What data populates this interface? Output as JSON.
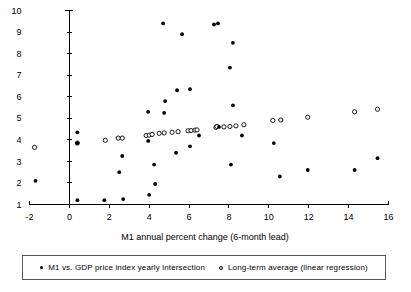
{
  "chart_data": {
    "type": "scatter",
    "title": "",
    "xlabel": "M1 annual percent change (6-month lead)",
    "ylabel": "",
    "xlim": [
      -2,
      16
    ],
    "ylim": [
      1,
      10
    ],
    "grid": false,
    "legend_position": "bottom",
    "xticks": [
      "-2",
      "0",
      "2",
      "4",
      "6",
      "8",
      "10",
      "12",
      "14",
      "16"
    ],
    "xtick_values": [
      -2,
      0,
      2,
      4,
      6,
      8,
      10,
      12,
      14,
      16
    ],
    "yticks": [
      "1",
      "2",
      "3",
      "4",
      "5",
      "6",
      "7",
      "8",
      "9",
      "10"
    ],
    "ytick_values": [
      1,
      2,
      3,
      4,
      5,
      6,
      7,
      8,
      9,
      10
    ],
    "series": [
      {
        "name": "M1 vs. GDP price index yearly intersection",
        "marker": "filled-circle",
        "color": "#000000",
        "points": [
          [
            -1.7,
            2.1
          ],
          [
            0.4,
            4.35
          ],
          [
            0.4,
            3.85
          ],
          [
            0.4,
            1.2
          ],
          [
            1.75,
            1.2
          ],
          [
            2.5,
            2.5
          ],
          [
            2.65,
            3.25
          ],
          [
            2.7,
            1.25
          ],
          [
            3.95,
            5.3
          ],
          [
            3.95,
            3.95
          ],
          [
            4.0,
            1.45
          ],
          [
            4.25,
            2.85
          ],
          [
            4.3,
            1.95
          ],
          [
            4.7,
            9.4
          ],
          [
            4.75,
            5.25
          ],
          [
            4.8,
            5.8
          ],
          [
            5.35,
            3.4
          ],
          [
            5.4,
            6.3
          ],
          [
            5.65,
            8.9
          ],
          [
            6.05,
            6.35
          ],
          [
            6.05,
            3.7
          ],
          [
            6.5,
            4.2
          ],
          [
            7.25,
            9.35
          ],
          [
            7.45,
            9.4
          ],
          [
            7.5,
            4.6
          ],
          [
            8.05,
            7.35
          ],
          [
            8.1,
            2.85
          ],
          [
            8.2,
            8.5
          ],
          [
            8.2,
            5.6
          ],
          [
            8.65,
            4.2
          ],
          [
            10.25,
            3.85
          ],
          [
            10.55,
            2.3
          ],
          [
            11.95,
            2.6
          ],
          [
            14.3,
            2.6
          ],
          [
            15.45,
            3.15
          ]
        ]
      },
      {
        "name": "Long-term average (linear regression)",
        "marker": "open-circle",
        "color": "#000000",
        "points": [
          [
            -1.75,
            3.65
          ],
          [
            0.4,
            3.85
          ],
          [
            1.8,
            3.98
          ],
          [
            2.45,
            4.08
          ],
          [
            2.65,
            4.08
          ],
          [
            3.85,
            4.2
          ],
          [
            4.0,
            4.22
          ],
          [
            4.15,
            4.25
          ],
          [
            4.5,
            4.3
          ],
          [
            4.75,
            4.32
          ],
          [
            5.15,
            4.35
          ],
          [
            5.45,
            4.38
          ],
          [
            5.95,
            4.42
          ],
          [
            6.1,
            4.43
          ],
          [
            6.3,
            4.45
          ],
          [
            6.4,
            4.46
          ],
          [
            7.35,
            4.58
          ],
          [
            7.4,
            4.62
          ],
          [
            7.75,
            4.6
          ],
          [
            8.05,
            4.62
          ],
          [
            8.35,
            4.65
          ],
          [
            8.75,
            4.7
          ],
          [
            10.2,
            4.9
          ],
          [
            10.6,
            4.92
          ],
          [
            11.95,
            5.05
          ],
          [
            14.3,
            5.3
          ],
          [
            15.45,
            5.42
          ]
        ]
      }
    ]
  },
  "legend": {
    "entries": [
      {
        "marker": "filled-circle",
        "label": "M1 vs. GDP price index yearly intersection"
      },
      {
        "marker": "open-circle",
        "label": "Long-term average (linear regression)"
      }
    ]
  }
}
